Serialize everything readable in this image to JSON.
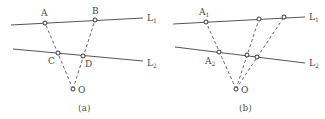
{
  "figure": {
    "panels": [
      {
        "id": "a",
        "caption": "(a)",
        "lines": [
          {
            "name": "L",
            "sub": "1",
            "x1": 11,
            "y1": 25,
            "x2": 143,
            "y2": 18,
            "label_x": 147,
            "label_y": 21
          },
          {
            "name": "L",
            "sub": "2",
            "x1": 13,
            "y1": 49,
            "x2": 143,
            "y2": 61,
            "label_x": 147,
            "label_y": 66
          }
        ],
        "points": [
          {
            "label": "A",
            "sub": "",
            "x": 45,
            "y": 23,
            "lx": 41,
            "ly": 16
          },
          {
            "label": "B",
            "sub": "",
            "x": 95,
            "y": 20,
            "lx": 92,
            "ly": 14
          },
          {
            "label": "C",
            "sub": "",
            "x": 58,
            "y": 53,
            "lx": 48,
            "ly": 64
          },
          {
            "label": "D",
            "sub": "",
            "x": 83,
            "y": 56,
            "lx": 85,
            "ly": 67
          },
          {
            "label": "O",
            "sub": "",
            "x": 73,
            "y": 89,
            "lx": 78,
            "ly": 93
          }
        ],
        "rays": [
          {
            "from": "O",
            "to": "A"
          },
          {
            "from": "O",
            "to": "B"
          }
        ]
      },
      {
        "id": "b",
        "caption": "(b)",
        "lines": [
          {
            "name": "L",
            "sub": "1",
            "x1": 173,
            "y1": 24,
            "x2": 305,
            "y2": 17,
            "label_x": 309,
            "label_y": 20
          },
          {
            "name": "L",
            "sub": "2",
            "x1": 175,
            "y1": 47,
            "x2": 305,
            "y2": 63,
            "label_x": 309,
            "label_y": 66
          }
        ],
        "points": [
          {
            "label": "A",
            "sub": "1",
            "x": 206,
            "y": 22,
            "lx": 199,
            "ly": 15
          },
          {
            "label": "",
            "sub": "",
            "x": 259,
            "y": 19,
            "lx": 0,
            "ly": 0
          },
          {
            "label": "",
            "sub": "",
            "x": 284,
            "y": 17,
            "lx": 0,
            "ly": 0
          },
          {
            "label": "A",
            "sub": "2",
            "x": 219,
            "y": 52,
            "lx": 205,
            "ly": 64
          },
          {
            "label": "",
            "sub": "",
            "x": 247,
            "y": 55,
            "lx": 0,
            "ly": 0
          },
          {
            "label": "",
            "sub": "",
            "x": 257,
            "y": 57,
            "lx": 0,
            "ly": 0
          },
          {
            "label": "O",
            "sub": "",
            "x": 236,
            "y": 89,
            "lx": 241,
            "ly": 93
          }
        ],
        "rays": [
          {
            "from": "O",
            "to": "A1"
          },
          {
            "from": "O",
            "to": "P1"
          },
          {
            "from": "O",
            "to": "P2"
          }
        ]
      }
    ]
  }
}
